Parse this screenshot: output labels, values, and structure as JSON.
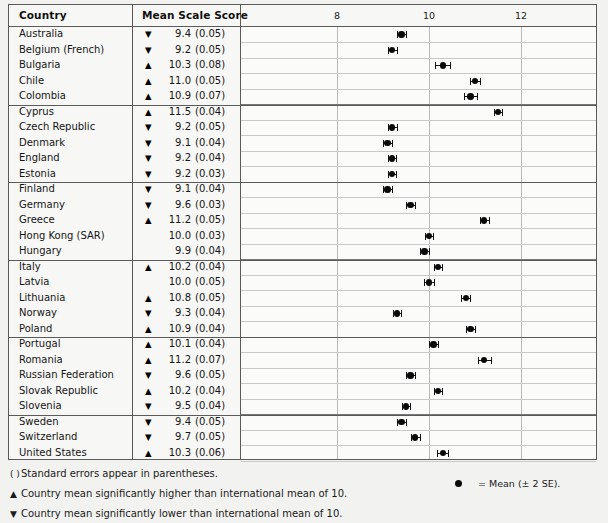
{
  "table": {
    "headers": {
      "country": "Country",
      "mean_scale_score": "Mean Scale Score"
    },
    "axis": {
      "ticks": [
        8,
        10,
        12
      ],
      "tick_labels": [
        "8",
        "10",
        "12"
      ],
      "min": 7.0,
      "max": 13.0
    },
    "international_mean": 10,
    "rows": [
      {
        "country": "Australia",
        "sig": "lower",
        "arrow": "▼",
        "mean": "9.4",
        "se": "(0.05)",
        "mean_value": 9.4,
        "se_value": 0.05
      },
      {
        "country": "Belgium (French)",
        "sig": "lower",
        "arrow": "▼",
        "mean": "9.2",
        "se": "(0.05)",
        "mean_value": 9.2,
        "se_value": 0.05
      },
      {
        "country": "Bulgaria",
        "sig": "higher",
        "arrow": "▲",
        "mean": "10.3",
        "se": "(0.08)",
        "mean_value": 10.3,
        "se_value": 0.08
      },
      {
        "country": "Chile",
        "sig": "higher",
        "arrow": "▲",
        "mean": "11.0",
        "se": "(0.05)",
        "mean_value": 11.0,
        "se_value": 0.05
      },
      {
        "country": "Colombia",
        "sig": "higher",
        "arrow": "▲",
        "mean": "10.9",
        "se": "(0.07)",
        "mean_value": 10.9,
        "se_value": 0.07
      },
      {
        "country": "Cyprus",
        "sig": "higher",
        "arrow": "▲",
        "mean": "11.5",
        "se": "(0.04)",
        "mean_value": 11.5,
        "se_value": 0.04
      },
      {
        "country": "Czech Republic",
        "sig": "lower",
        "arrow": "▼",
        "mean": "9.2",
        "se": "(0.05)",
        "mean_value": 9.2,
        "se_value": 0.05
      },
      {
        "country": "Denmark",
        "sig": "lower",
        "arrow": "▼",
        "mean": "9.1",
        "se": "(0.04)",
        "mean_value": 9.1,
        "se_value": 0.04
      },
      {
        "country": "England",
        "sig": "lower",
        "arrow": "▼",
        "mean": "9.2",
        "se": "(0.04)",
        "mean_value": 9.2,
        "se_value": 0.04
      },
      {
        "country": "Estonia",
        "sig": "lower",
        "arrow": "▼",
        "mean": "9.2",
        "se": "(0.03)",
        "mean_value": 9.2,
        "se_value": 0.03
      },
      {
        "country": "Finland",
        "sig": "lower",
        "arrow": "▼",
        "mean": "9.1",
        "se": "(0.04)",
        "mean_value": 9.1,
        "se_value": 0.04
      },
      {
        "country": "Germany",
        "sig": "lower",
        "arrow": "▼",
        "mean": "9.6",
        "se": "(0.03)",
        "mean_value": 9.6,
        "se_value": 0.03
      },
      {
        "country": "Greece",
        "sig": "higher",
        "arrow": "▲",
        "mean": "11.2",
        "se": "(0.05)",
        "mean_value": 11.2,
        "se_value": 0.05
      },
      {
        "country": "Hong Kong (SAR)",
        "sig": "none",
        "arrow": "",
        "mean": "10.0",
        "se": "(0.03)",
        "mean_value": 10.0,
        "se_value": 0.03
      },
      {
        "country": "Hungary",
        "sig": "none",
        "arrow": "",
        "mean": "9.9",
        "se": "(0.04)",
        "mean_value": 9.9,
        "se_value": 0.04
      },
      {
        "country": "Italy",
        "sig": "higher",
        "arrow": "▲",
        "mean": "10.2",
        "se": "(0.04)",
        "mean_value": 10.2,
        "se_value": 0.04
      },
      {
        "country": "Latvia",
        "sig": "none",
        "arrow": "",
        "mean": "10.0",
        "se": "(0.05)",
        "mean_value": 10.0,
        "se_value": 0.05
      },
      {
        "country": "Lithuania",
        "sig": "higher",
        "arrow": "▲",
        "mean": "10.8",
        "se": "(0.05)",
        "mean_value": 10.8,
        "se_value": 0.05
      },
      {
        "country": "Norway",
        "sig": "lower",
        "arrow": "▼",
        "mean": "9.3",
        "se": "(0.04)",
        "mean_value": 9.3,
        "se_value": 0.04
      },
      {
        "country": "Poland",
        "sig": "higher",
        "arrow": "▲",
        "mean": "10.9",
        "se": "(0.04)",
        "mean_value": 10.9,
        "se_value": 0.04
      },
      {
        "country": "Portugal",
        "sig": "higher",
        "arrow": "▲",
        "mean": "10.1",
        "se": "(0.04)",
        "mean_value": 10.1,
        "se_value": 0.04
      },
      {
        "country": "Romania",
        "sig": "higher",
        "arrow": "▲",
        "mean": "11.2",
        "se": "(0.07)",
        "mean_value": 11.2,
        "se_value": 0.07
      },
      {
        "country": "Russian Federation",
        "sig": "lower",
        "arrow": "▼",
        "mean": "9.6",
        "se": "(0.05)",
        "mean_value": 9.6,
        "se_value": 0.05
      },
      {
        "country": "Slovak Republic",
        "sig": "higher",
        "arrow": "▲",
        "mean": "10.2",
        "se": "(0.04)",
        "mean_value": 10.2,
        "se_value": 0.04
      },
      {
        "country": "Slovenia",
        "sig": "lower",
        "arrow": "▼",
        "mean": "9.5",
        "se": "(0.04)",
        "mean_value": 9.5,
        "se_value": 0.04
      },
      {
        "country": "Sweden",
        "sig": "lower",
        "arrow": "▼",
        "mean": "9.4",
        "se": "(0.05)",
        "mean_value": 9.4,
        "se_value": 0.05
      },
      {
        "country": "Switzerland",
        "sig": "lower",
        "arrow": "▼",
        "mean": "9.7",
        "se": "(0.05)",
        "mean_value": 9.7,
        "se_value": 0.05
      },
      {
        "country": "United States",
        "sig": "higher",
        "arrow": "▲",
        "mean": "10.3",
        "se": "(0.06)",
        "mean_value": 10.3,
        "se_value": 0.06
      }
    ],
    "group_breaks": [
      5,
      10,
      15,
      20,
      25
    ]
  },
  "footnotes": [
    {
      "symbol": "( )",
      "text": "Standard errors appear in parentheses."
    },
    {
      "symbol": "▲",
      "text": "Country mean significantly higher than international mean of 10."
    },
    {
      "symbol": "▼",
      "text": "Country mean significantly lower than international mean of 10."
    }
  ],
  "legend": {
    "marker": "dot",
    "text": "= Mean (± 2 SE)."
  },
  "chart_data": {
    "type": "scatter",
    "title": "",
    "xlabel": "",
    "ylabel": "",
    "xlim": [
      7.0,
      13.0
    ],
    "grid": true,
    "legend_position": "bottom-right",
    "categories": [
      "Australia",
      "Belgium (French)",
      "Bulgaria",
      "Chile",
      "Colombia",
      "Cyprus",
      "Czech Republic",
      "Denmark",
      "England",
      "Estonia",
      "Finland",
      "Germany",
      "Greece",
      "Hong Kong (SAR)",
      "Hungary",
      "Italy",
      "Latvia",
      "Lithuania",
      "Norway",
      "Poland",
      "Portugal",
      "Romania",
      "Russian Federation",
      "Slovak Republic",
      "Slovenia",
      "Sweden",
      "Switzerland",
      "United States"
    ],
    "values": [
      9.4,
      9.2,
      10.3,
      11.0,
      10.9,
      11.5,
      9.2,
      9.1,
      9.2,
      9.2,
      9.1,
      9.6,
      11.2,
      10.0,
      9.9,
      10.2,
      10.0,
      10.8,
      9.3,
      10.9,
      10.1,
      11.2,
      9.6,
      10.2,
      9.5,
      9.4,
      9.7,
      10.3
    ],
    "errors_se": [
      0.05,
      0.05,
      0.08,
      0.05,
      0.07,
      0.04,
      0.05,
      0.04,
      0.04,
      0.03,
      0.04,
      0.03,
      0.05,
      0.03,
      0.04,
      0.04,
      0.05,
      0.05,
      0.04,
      0.04,
      0.04,
      0.07,
      0.05,
      0.04,
      0.04,
      0.05,
      0.05,
      0.06
    ],
    "error_multiplier": 2,
    "tick_labels": [
      "8",
      "10",
      "12"
    ],
    "ticks": [
      8,
      10,
      12
    ]
  }
}
